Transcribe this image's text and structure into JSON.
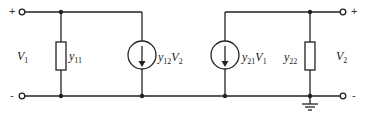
{
  "diagram": {
    "type": "circuit",
    "port1": {
      "voltage_label": "V",
      "voltage_sub": "1",
      "plus": "+",
      "minus": "-"
    },
    "port2": {
      "voltage_label": "V",
      "voltage_sub": "2",
      "plus": "+",
      "minus": "-"
    },
    "elements": {
      "y11": {
        "label": "y",
        "sub": "11",
        "kind": "admittance"
      },
      "src12": {
        "label": "y",
        "sub": "12",
        "ctrl": "V",
        "ctrl_sub": "2",
        "kind": "dependent-current-source"
      },
      "src21": {
        "label": "y",
        "sub": "21",
        "ctrl": "V",
        "ctrl_sub": "1",
        "kind": "dependent-current-source"
      },
      "y22": {
        "label": "y",
        "sub": "22",
        "kind": "admittance"
      }
    },
    "colors": {
      "line": "#222222",
      "background": "#ffffff"
    }
  }
}
